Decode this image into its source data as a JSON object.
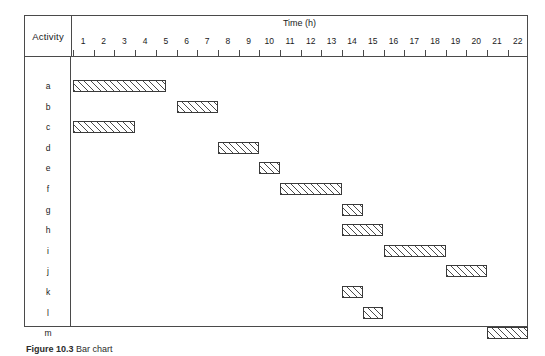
{
  "figure": {
    "caption_label": "Figure 10.3",
    "caption_text": "Bar chart",
    "activity_header": "Activity",
    "axis_title": "Time (h)"
  },
  "chart_data": {
    "type": "bar",
    "title": "",
    "xlabel": "Time (h)",
    "ylabel": "Activity",
    "xlim": [
      1,
      22
    ],
    "grid": false,
    "legend": "none",
    "orientation": "horizontal-gantt",
    "xticks": [
      1,
      2,
      3,
      4,
      5,
      6,
      7,
      8,
      9,
      10,
      11,
      12,
      13,
      14,
      15,
      16,
      17,
      18,
      19,
      20,
      21,
      22
    ],
    "categories": [
      "a",
      "b",
      "c",
      "d",
      "e",
      "f",
      "g",
      "h",
      "i",
      "j",
      "k",
      "l",
      "m"
    ],
    "bars": [
      {
        "activity": "a",
        "start": 1,
        "end": 5.5
      },
      {
        "activity": "b",
        "start": 6,
        "end": 8
      },
      {
        "activity": "c",
        "start": 1,
        "end": 4
      },
      {
        "activity": "d",
        "start": 8,
        "end": 10
      },
      {
        "activity": "e",
        "start": 10,
        "end": 11
      },
      {
        "activity": "f",
        "start": 11,
        "end": 14
      },
      {
        "activity": "g",
        "start": 14,
        "end": 15
      },
      {
        "activity": "h",
        "start": 14,
        "end": 16
      },
      {
        "activity": "i",
        "start": 16,
        "end": 19
      },
      {
        "activity": "j",
        "start": 19,
        "end": 21
      },
      {
        "activity": "k",
        "start": 14,
        "end": 15
      },
      {
        "activity": "l",
        "start": 15,
        "end": 16
      },
      {
        "activity": "m",
        "start": 21,
        "end": 23
      }
    ]
  }
}
